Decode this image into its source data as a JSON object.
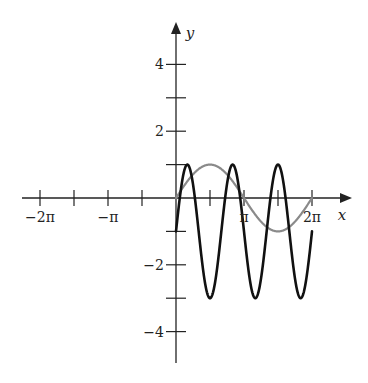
{
  "chart_data": {
    "type": "line",
    "title": "",
    "xlabel": "x",
    "ylabel": "y",
    "xlim": [
      -6.8,
      7.3
    ],
    "ylim": [
      -5,
      5.3
    ],
    "grid": false,
    "legend": null,
    "x_ticks": [
      {
        "value": -6.2832,
        "label": "−2π"
      },
      {
        "value": -4.7124,
        "label": ""
      },
      {
        "value": -3.1416,
        "label": "−π"
      },
      {
        "value": -1.5708,
        "label": ""
      },
      {
        "value": 1.5708,
        "label": ""
      },
      {
        "value": 3.1416,
        "label": "π"
      },
      {
        "value": 4.7124,
        "label": ""
      },
      {
        "value": 6.2832,
        "label": "2π"
      }
    ],
    "y_ticks": [
      {
        "value": 4,
        "label": "4"
      },
      {
        "value": 3,
        "label": ""
      },
      {
        "value": 2,
        "label": "2"
      },
      {
        "value": 1,
        "label": ""
      },
      {
        "value": -1,
        "label": ""
      },
      {
        "value": -2,
        "label": "−2"
      },
      {
        "value": -3,
        "label": ""
      },
      {
        "value": -4,
        "label": "−4"
      }
    ],
    "series": [
      {
        "name": "y = sin(x)",
        "color": "#8a8a8a",
        "domain": [
          0,
          6.2832
        ],
        "formula": "sin(x)",
        "x": [
          0,
          0.7854,
          1.5708,
          2.3562,
          3.1416,
          3.927,
          4.7124,
          5.4978,
          6.2832
        ],
        "values": [
          0,
          0.707,
          1,
          0.707,
          0,
          -0.707,
          -1,
          -0.707,
          0
        ]
      },
      {
        "name": "y = 2 sin(3x) − 1",
        "color": "#111111",
        "domain": [
          0,
          6.2832
        ],
        "formula": "2*sin(3x)-1",
        "x": [
          0,
          0.5236,
          1.0472,
          1.5708,
          2.0944,
          2.618,
          3.1416,
          3.6652,
          4.1888,
          4.7124,
          5.236,
          5.7596,
          6.2832
        ],
        "values": [
          -1,
          1,
          -1,
          -3,
          -1,
          1,
          -1,
          -3,
          -1,
          1,
          -1,
          -3,
          -1
        ]
      }
    ]
  }
}
